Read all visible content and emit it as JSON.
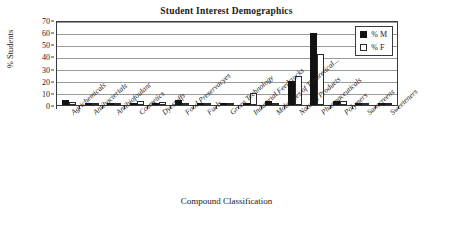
{
  "chart_data": {
    "type": "bar",
    "title": "Student Interest Demographics",
    "xlabel": "Compound Classification",
    "ylabel": "% Students",
    "ylim": [
      0,
      70
    ],
    "ytick_step": 10,
    "yticks": [
      0,
      10,
      20,
      30,
      40,
      50,
      60,
      70
    ],
    "grid": true,
    "legend_position": "top-right-inside",
    "categories": [
      "Agrichemicals",
      "Antibacterials",
      "Antibiofoulant",
      "Cosmetics",
      "Dyestuffs",
      "Food Preservacyes",
      "Fuels",
      "Green Technology",
      "Industrial Feedstocks",
      "Molecules of Theoretical...",
      "Natural Products",
      "Pharmaceuticals",
      "Polymers",
      "Sunscreens",
      "Sweeteners"
    ],
    "series": [
      {
        "name": "% M",
        "color": "#121212",
        "values": [
          4,
          0.5,
          0.5,
          1,
          1,
          4,
          0.3,
          0.5,
          2,
          3.5,
          20,
          59,
          3.5,
          0.3,
          0.3
        ]
      },
      {
        "name": "% F",
        "color": "#ffffff",
        "values": [
          2.5,
          0.5,
          0.5,
          3,
          2.5,
          1.5,
          0.3,
          1,
          10,
          0.3,
          24,
          42,
          3.5,
          1,
          1.5
        ]
      }
    ]
  },
  "legend": {
    "entries": [
      {
        "label": "% M"
      },
      {
        "label": "% F"
      }
    ]
  },
  "colors": {
    "male_fill": "#121212",
    "female_fill": "#ffffff",
    "axis": "#3a3a3a",
    "grid": "#9a9a9a",
    "background": "#ffffff"
  }
}
